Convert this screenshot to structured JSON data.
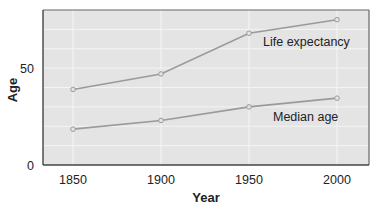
{
  "chart_data": {
    "type": "line",
    "title": "",
    "xlabel": "Year",
    "ylabel": "Age",
    "x": [
      1850,
      1900,
      1950,
      2000
    ],
    "xlim": [
      1827,
      2018
    ],
    "ylim": [
      0,
      80
    ],
    "xticks": [
      "1850",
      "1900",
      "1950",
      "2000"
    ],
    "yticks": [
      "0",
      "50"
    ],
    "grid": true,
    "legend": "inline labels",
    "series": [
      {
        "name": "Life expectancy",
        "values": [
          39,
          47,
          68,
          75
        ]
      },
      {
        "name": "Median age",
        "values": [
          18.5,
          23,
          30,
          34.5
        ]
      }
    ]
  },
  "colors": {
    "plot_background": "#e4e4e4",
    "grid": "#f4f4f4",
    "line": "#9a9a9a",
    "axis": "#555555"
  },
  "labels": {
    "life_expectancy": "Life expectancy",
    "median_age": "Median age",
    "x_axis": "Year",
    "y_axis": "Age",
    "xtick_0": "1850",
    "xtick_1": "1900",
    "xtick_2": "1950",
    "xtick_3": "2000",
    "ytick_0": "0",
    "ytick_50": "50"
  }
}
